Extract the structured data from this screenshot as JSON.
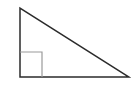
{
  "diagram": {
    "type": "right-triangle",
    "vertices": {
      "top": [
        20,
        8
      ],
      "right_angle": [
        20,
        77
      ],
      "bottom_right": [
        129,
        77
      ]
    },
    "right_angle_marker": {
      "x": 20,
      "y": 52,
      "width": 22,
      "height": 25
    },
    "colors": {
      "background": "#ffffff",
      "triangle_stroke": "#2b2b2b",
      "marker_stroke": "#9a9a9a"
    }
  }
}
